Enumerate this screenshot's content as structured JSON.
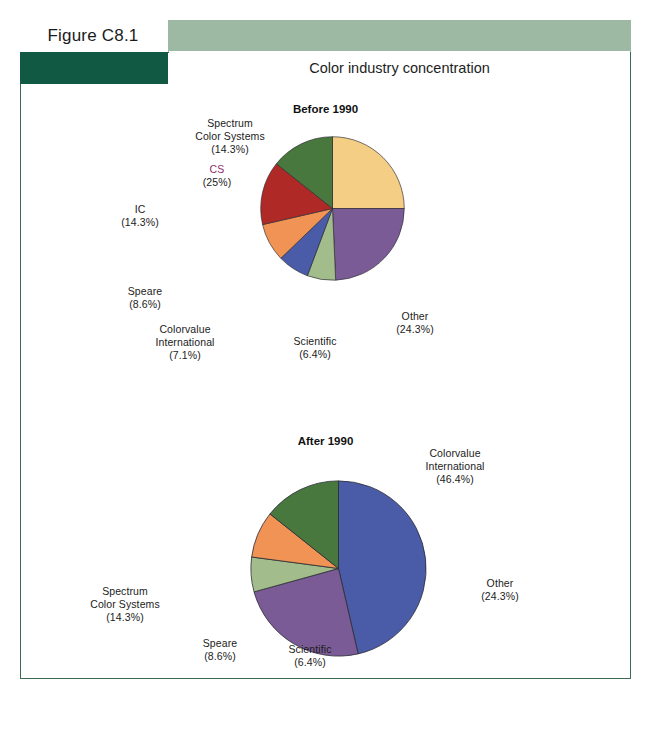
{
  "figure": {
    "label": "Figure C8.1",
    "title": "Color industry concentration"
  },
  "theme": {
    "band_light": "#9db8a3",
    "band_dark": "#115943",
    "frame_border": "#3c6b55",
    "accent_label": "#8d2d6b"
  },
  "chart_data": [
    {
      "type": "pie",
      "title": "Before 1990",
      "labels": [
        "CS",
        "Other",
        "Scientific",
        "Colorvalue International",
        "Speare",
        "IC",
        "Spectrum Color Systems"
      ],
      "values": [
        25.0,
        24.3,
        6.4,
        7.1,
        8.6,
        14.3,
        14.3
      ],
      "value_labels": [
        "(25%)",
        "(24.3%)",
        "(6.4%)",
        "(7.1%)",
        "(8.6%)",
        "(14.3%)",
        "(14.3%)"
      ],
      "colors": [
        "#f5ce85",
        "#7b5b96",
        "#a3bc8c",
        "#4a5ba8",
        "#f09355",
        "#af2a26",
        "#49783e"
      ],
      "start_angle": 0,
      "direction": "clockwise",
      "legend": "none",
      "annotations": [
        {
          "name": "Spectrum\nColor Systems",
          "pct": "(14.3%)",
          "slot": "l1-spectrum",
          "align": "c",
          "accent": false
        },
        {
          "name": "CS",
          "pct": "(25%)",
          "slot": "l1-cs",
          "align": "c",
          "accent": true
        },
        {
          "name": "IC",
          "pct": "(14.3%)",
          "slot": "l1-ic",
          "align": "c",
          "accent": false
        },
        {
          "name": "Speare",
          "pct": "(8.6%)",
          "slot": "l1-speare",
          "align": "c",
          "accent": false
        },
        {
          "name": "Colorvalue\nInternational",
          "pct": "(7.1%)",
          "slot": "l1-colorvalue",
          "align": "c",
          "accent": false
        },
        {
          "name": "Scientific",
          "pct": "(6.4%)",
          "slot": "l1-scientific",
          "align": "c",
          "accent": false
        },
        {
          "name": "Other",
          "pct": "(24.3%)",
          "slot": "l1-other",
          "align": "c",
          "accent": false
        }
      ]
    },
    {
      "type": "pie",
      "title": "After 1990",
      "labels": [
        "Colorvalue International",
        "Other",
        "Scientific",
        "Speare",
        "Spectrum Color Systems"
      ],
      "values": [
        46.4,
        24.3,
        6.4,
        8.6,
        14.3
      ],
      "value_labels": [
        "(46.4%)",
        "(24.3%)",
        "(6.4%)",
        "(8.6%)",
        "(14.3%)"
      ],
      "colors": [
        "#4a5ba8",
        "#7b5b96",
        "#a3bc8c",
        "#f09355",
        "#49783e"
      ],
      "start_angle": 0,
      "direction": "clockwise",
      "legend": "none",
      "annotations": [
        {
          "name": "Colorvalue\nInternational",
          "pct": "(46.4%)",
          "slot": "l2-colorvalue",
          "align": "c",
          "accent": false
        },
        {
          "name": "Spectrum\nColor Systems",
          "pct": "(14.3%)",
          "slot": "l2-spectrum",
          "align": "c",
          "accent": false
        },
        {
          "name": "Speare",
          "pct": "(8.6%)",
          "slot": "l2-speare",
          "align": "c",
          "accent": false
        },
        {
          "name": "Scientific",
          "pct": "(6.4%)",
          "slot": "l2-scientific",
          "align": "c",
          "accent": false
        },
        {
          "name": "Other",
          "pct": "(24.3%)",
          "slot": "l2-other",
          "align": "c",
          "accent": false
        }
      ]
    }
  ]
}
